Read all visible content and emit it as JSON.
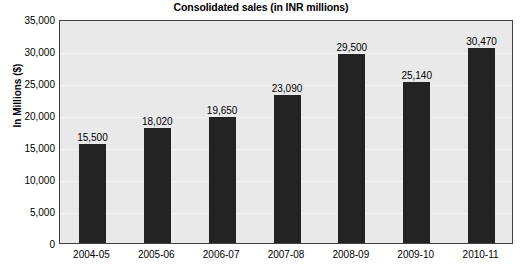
{
  "chart_data": {
    "type": "bar",
    "title": "Consolidated sales (in INR millions)",
    "xlabel": "",
    "ylabel": "In Millions ($)",
    "categories": [
      "2004-05",
      "2005-06",
      "2006-07",
      "2007-08",
      "2008-09",
      "2009-10",
      "2010-11"
    ],
    "values": [
      15500,
      18020,
      19650,
      23090,
      29500,
      25140,
      30470
    ],
    "value_labels": [
      "15,500",
      "18,020",
      "19,650",
      "23,090",
      "29,500",
      "25,140",
      "30,470"
    ],
    "ylim": [
      0,
      35000
    ],
    "ytick_values": [
      0,
      5000,
      10000,
      15000,
      20000,
      25000,
      30000,
      35000
    ],
    "ytick_labels": [
      "0",
      "5,000",
      "10,000",
      "15,000",
      "20,000",
      "25,000",
      "30,000",
      "35,000"
    ],
    "grid": true,
    "legend": false,
    "series": [
      {
        "name": "Consolidated sales",
        "values": [
          15500,
          18020,
          19650,
          23090,
          29500,
          25140,
          30470
        ]
      }
    ],
    "colors": {
      "bar": "#232323",
      "plot_background": "#e9e9e9",
      "figure_background": "#ffffff",
      "gridline": "#f4f4f4",
      "frame": "#404040",
      "text": "#000000"
    }
  }
}
